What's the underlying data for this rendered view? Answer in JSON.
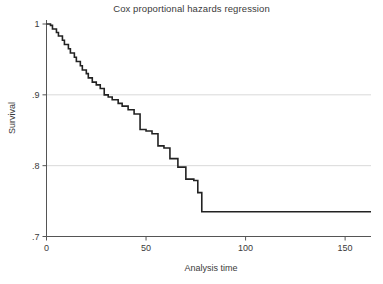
{
  "chart_data": {
    "type": "line",
    "subtype": "step-survival-curve",
    "title": "Cox proportional hazards regression",
    "xlabel": "Analysis time",
    "ylabel": "Survival",
    "xlim": [
      0,
      163
    ],
    "ylim": [
      0.7,
      1.0
    ],
    "xticks": [
      0,
      50,
      100,
      150
    ],
    "xtick_labels": [
      "0",
      "50",
      "100",
      "150"
    ],
    "yticks": [
      0.7,
      0.8,
      0.9,
      1.0
    ],
    "ytick_labels": [
      ".7",
      ".8",
      ".9",
      "1"
    ],
    "grid": "horizontal",
    "gridlines_y": [
      0.7,
      0.8,
      0.9
    ],
    "legend": "none",
    "line_color": "#222222",
    "grid_color": "#d9d9d9",
    "axis_color": "#555555",
    "background_color": "#ffffff",
    "series": [
      {
        "name": "Survival",
        "step": "post",
        "x": [
          0,
          2,
          3,
          5,
          6,
          8,
          9,
          11,
          12,
          14,
          15,
          17,
          18,
          20,
          21,
          23,
          25,
          27,
          29,
          31,
          33,
          36,
          38,
          41,
          44,
          47,
          50,
          53,
          56,
          59,
          62,
          66,
          70,
          74,
          76,
          78,
          163
        ],
        "y": [
          1.0,
          0.998,
          0.993,
          0.988,
          0.983,
          0.977,
          0.971,
          0.965,
          0.959,
          0.953,
          0.947,
          0.941,
          0.935,
          0.93,
          0.924,
          0.918,
          0.914,
          0.909,
          0.9,
          0.897,
          0.893,
          0.888,
          0.884,
          0.879,
          0.873,
          0.851,
          0.849,
          0.845,
          0.828,
          0.825,
          0.81,
          0.798,
          0.781,
          0.779,
          0.762,
          0.735,
          0.735
        ]
      }
    ]
  }
}
